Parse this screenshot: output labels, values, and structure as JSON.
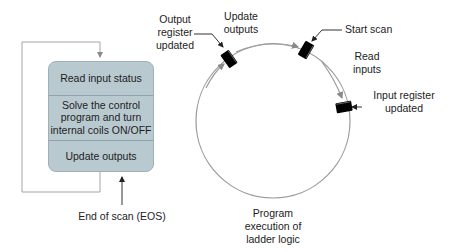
{
  "scan_box": {
    "steps": [
      {
        "label": "Read input status"
      },
      {
        "label_line1": "Solve the control",
        "label_line2": "program and turn",
        "label_line3": "internal coils ON/OFF"
      },
      {
        "label": "Update outputs"
      }
    ],
    "eos_label": "End of scan (EOS)"
  },
  "scan_cycle": {
    "output_register": {
      "line1": "Output",
      "line2": "register",
      "line3": "updated"
    },
    "update_outputs": {
      "line1": "Update",
      "line2": "outputs"
    },
    "start_scan": "Start scan",
    "read_inputs": {
      "line1": "Read",
      "line2": "inputs"
    },
    "input_register": {
      "line1": "Input register",
      "line2": "updated"
    },
    "program_execution": {
      "line1": "Program",
      "line2": "execution of",
      "line3": "ladder logic"
    }
  },
  "colors": {
    "box_fill": "#b9c9d0",
    "circle_stroke": "#9a9a9a",
    "loop_stroke": "#a0a0a0",
    "marker": "#000000"
  }
}
